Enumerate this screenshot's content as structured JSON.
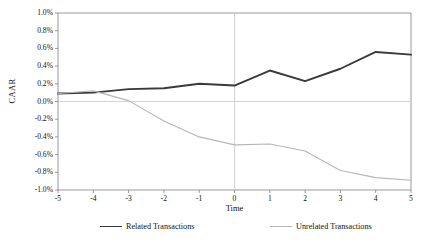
{
  "chart_data": {
    "type": "line",
    "title": "",
    "xlabel": "Time",
    "ylabel": "CAAR",
    "x": [
      -5,
      -4,
      -3,
      -2,
      -1,
      0,
      1,
      2,
      3,
      4,
      5
    ],
    "xtick_labels": [
      "-5",
      "-4",
      "-3",
      "-2",
      "-1",
      "0",
      "1",
      "2",
      "3",
      "4",
      "5"
    ],
    "xlim": [
      -5,
      5
    ],
    "ylim": [
      -1.0,
      1.0
    ],
    "ytick_values": [
      1.0,
      0.8,
      0.6,
      0.4,
      0.2,
      0.0,
      -0.2,
      -0.4,
      -0.6,
      -0.8,
      -1.0
    ],
    "ytick_labels": [
      "1.0%",
      "0.8%",
      "0.6%",
      "0.4%",
      "0.2%",
      "0.0%",
      "-0.2%",
      "-0.4%",
      "-0.6%",
      "-0.8%",
      "-1.0%"
    ],
    "grid": false,
    "zero_line": true,
    "event_line_x": 0,
    "legend_position": "bottom",
    "units": "percent",
    "series": [
      {
        "name": "Related Transactions",
        "color": "#3a3a3a",
        "width": 1.9,
        "values": [
          0.09,
          0.1,
          0.14,
          0.15,
          0.2,
          0.18,
          0.35,
          0.23,
          0.37,
          0.56,
          0.53
        ]
      },
      {
        "name": "Unrelated Transactions",
        "color": "#b6b6b6",
        "width": 1.1,
        "values": [
          0.09,
          0.12,
          0.01,
          -0.22,
          -0.4,
          -0.49,
          -0.48,
          -0.56,
          -0.78,
          -0.86,
          -0.89
        ]
      }
    ]
  },
  "axis": {
    "y_title": "CAAR",
    "x_title": "Time"
  },
  "legend": {
    "items": [
      {
        "label": "Related Transactions"
      },
      {
        "label": "Unrelated Transactions"
      }
    ]
  },
  "colors": {
    "related": "#3a3a3a",
    "unrelated": "#b6b6b6",
    "axis": "#808080",
    "zero_line": "#c8c8c8",
    "event_line": "#c8c8c8",
    "text": "#111111",
    "background": "#ffffff"
  }
}
